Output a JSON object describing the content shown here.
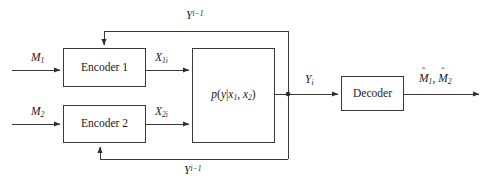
{
  "diagram": {
    "stroke_color": "#3a3a3a",
    "text_color": "#1a1a1a",
    "background": "#ffffff",
    "blocks": [
      {
        "id": "encoder1",
        "label": "Encoder 1"
      },
      {
        "id": "encoder2",
        "label": "Encoder 2"
      },
      {
        "id": "channel",
        "label_prefix": "p(y|x",
        "label_sub1": "1",
        "label_mid": ", x",
        "label_sub2": "2",
        "label_suffix": ")"
      },
      {
        "id": "decoder",
        "label": "Decoder"
      }
    ],
    "signals": {
      "message1": {
        "base": "M",
        "sub": "1"
      },
      "message2": {
        "base": "M",
        "sub": "2"
      },
      "codeword1": {
        "base": "X",
        "sub": "1i"
      },
      "codeword2": {
        "base": "X",
        "sub": "2i"
      },
      "channel_output": {
        "base": "Y",
        "sub": "i"
      },
      "feedback_top": {
        "base": "Y",
        "sup": "i−1"
      },
      "feedback_bottom": {
        "base": "Y",
        "sup": "i−1"
      },
      "estimate1": {
        "hat": "ˆ",
        "base": "M",
        "sub": "1"
      },
      "estimate2": {
        "hat": "ˆ",
        "base": "M",
        "sub": "2"
      },
      "estimates_separator": ", "
    },
    "block_labels": {
      "encoder1": "Encoder 1",
      "encoder2": "Encoder 2",
      "decoder": "Decoder"
    }
  }
}
